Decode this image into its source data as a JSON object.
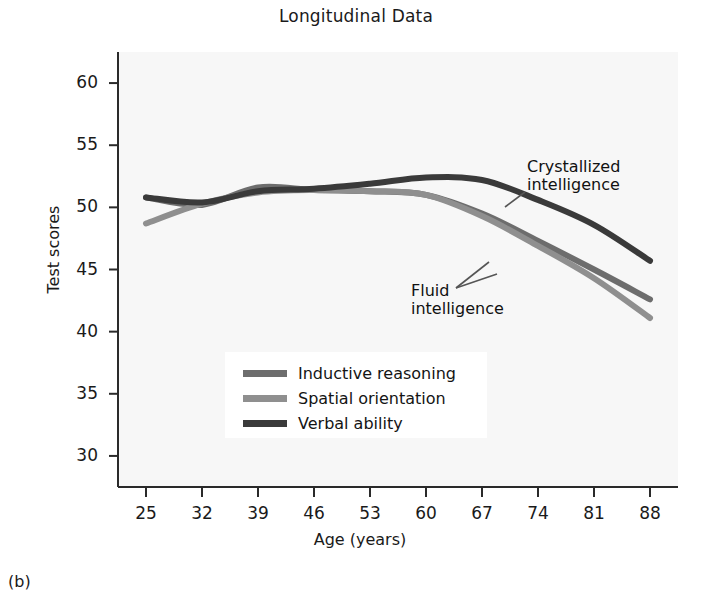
{
  "figure": {
    "title": "Longitudinal Data",
    "panel_label": "(b)"
  },
  "annotations": {
    "crystallized": "Crystallized\nintelligence",
    "fluid": "Fluid\nintelligence"
  },
  "legend": {
    "items": [
      {
        "label": "Inductive reasoning",
        "color": "#6d6d6d"
      },
      {
        "label": "Spatial orientation",
        "color": "#8f8f8f"
      },
      {
        "label": "Verbal ability",
        "color": "#3a3a3a"
      }
    ]
  },
  "chart_data": {
    "type": "line",
    "title": "Longitudinal Data",
    "xlabel": "Age (years)",
    "ylabel": "Test scores",
    "x": [
      25,
      32,
      39,
      46,
      53,
      60,
      67,
      74,
      81,
      88
    ],
    "xticklabels": [
      "25",
      "32",
      "39",
      "46",
      "53",
      "60",
      "67",
      "74",
      "81",
      "88"
    ],
    "yticks": [
      30,
      35,
      40,
      45,
      50,
      55,
      60
    ],
    "yticklabels": [
      "30",
      "35",
      "40",
      "45",
      "50",
      "55",
      "60"
    ],
    "xlim": [
      21.5,
      91.5
    ],
    "ylim": [
      27.5,
      62.5
    ],
    "grid": false,
    "legend_position": "center-left",
    "series": [
      {
        "name": "Inductive reasoning",
        "color": "#6d6d6d",
        "values": [
          50.8,
          50.2,
          51.6,
          51.4,
          51.3,
          51.0,
          49.5,
          47.3,
          45.0,
          42.6
        ]
      },
      {
        "name": "Spatial orientation",
        "color": "#8f8f8f",
        "values": [
          48.7,
          50.3,
          51.2,
          51.4,
          51.3,
          51.0,
          49.3,
          46.9,
          44.3,
          41.1
        ]
      },
      {
        "name": "Verbal ability",
        "color": "#3a3a3a",
        "values": [
          50.8,
          50.4,
          51.3,
          51.5,
          51.9,
          52.4,
          52.2,
          50.6,
          48.6,
          45.7
        ]
      }
    ],
    "annotations": [
      {
        "text": "Crystallized intelligence",
        "points_to": "Verbal ability"
      },
      {
        "text": "Fluid intelligence",
        "points_to": "Inductive reasoning, Spatial orientation"
      }
    ]
  }
}
